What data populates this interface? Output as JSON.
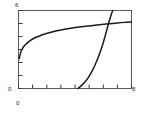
{
  "figure": {
    "name": "two-curve-plot",
    "background": "#ffffff",
    "line_color": "#1a1a1a",
    "axis_color": "#4d4d4d"
  },
  "labels": {
    "y_max": "6",
    "y_min": "0",
    "x_min": "0",
    "x_max": "8"
  },
  "chart_data": {
    "type": "line",
    "title": "",
    "subtitle": "",
    "xlabel": "",
    "ylabel": "",
    "xlim": [
      0,
      8
    ],
    "ylim": [
      0,
      6
    ],
    "grid": false,
    "legend": "none",
    "xticks": [
      0,
      1,
      2,
      3,
      4,
      5,
      6,
      7,
      8
    ],
    "xticklabels": [
      "0",
      "",
      "",
      "",
      "",
      "",
      "",
      "",
      "8"
    ],
    "yticks": [
      0,
      1,
      2,
      3,
      4,
      5,
      6
    ],
    "yticklabels": [
      "0",
      "",
      "",
      "",
      "",
      "",
      "6"
    ],
    "tick_direction": "in",
    "frame": "box",
    "annotations": [],
    "series": [
      {
        "name": "logarithmic-curve",
        "type": "line",
        "color": "#1a1a1a",
        "x": [
          0.05,
          0.15,
          0.3,
          0.5,
          0.8,
          1.2,
          1.7,
          2.3,
          3.0,
          3.8,
          4.6,
          5.4,
          6.2,
          7.0,
          7.6,
          8.0
        ],
        "y": [
          2.3,
          2.75,
          3.1,
          3.38,
          3.66,
          3.92,
          4.14,
          4.33,
          4.5,
          4.65,
          4.77,
          4.87,
          4.96,
          5.04,
          5.09,
          5.12
        ]
      },
      {
        "name": "exponential-curve",
        "type": "line",
        "color": "#1a1a1a",
        "x": [
          4.2,
          4.45,
          4.7,
          4.95,
          5.2,
          5.45,
          5.7,
          5.95,
          6.15,
          6.35,
          6.5,
          6.6,
          6.68
        ],
        "y": [
          0.0,
          0.22,
          0.5,
          0.86,
          1.32,
          1.88,
          2.55,
          3.35,
          4.1,
          4.9,
          5.45,
          5.8,
          6.0
        ]
      }
    ],
    "intersection": {
      "x": 6.3,
      "y": 4.85
    }
  }
}
